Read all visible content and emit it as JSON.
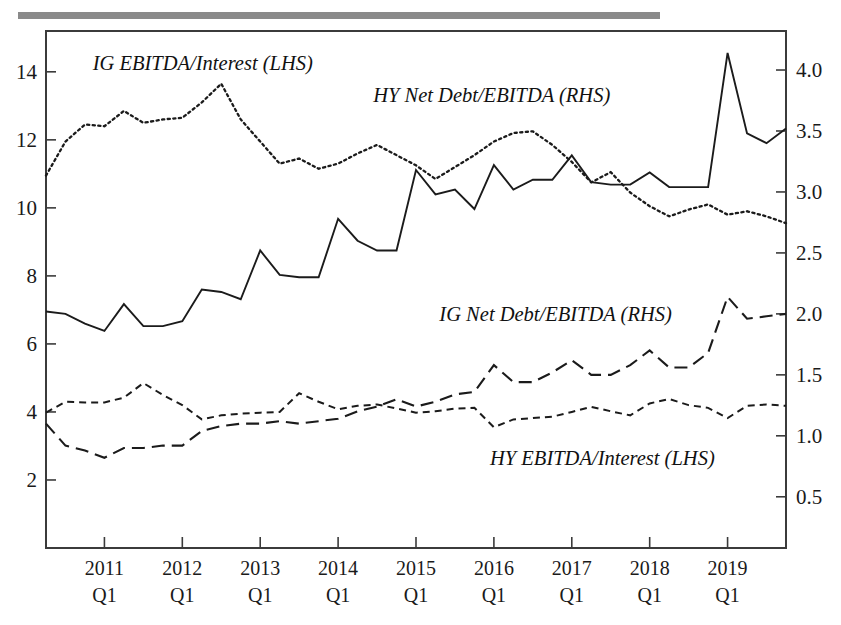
{
  "figure": {
    "top_rule": true,
    "background_color": "#ffffff",
    "line_color": "#1b1b1b"
  },
  "chart_data": {
    "type": "line",
    "title": "",
    "subtitle": "",
    "xlabel": "",
    "ylabel": "",
    "grid": false,
    "legend_position": "inline-annotations",
    "x_axis": {
      "tick_labels": [
        "2011",
        "2012",
        "2013",
        "2014",
        "2015",
        "2016",
        "2017",
        "2018",
        "2019"
      ],
      "tick_sublabels": [
        "Q1",
        "Q1",
        "Q1",
        "Q1",
        "Q1",
        "Q1",
        "Q1",
        "Q1",
        "Q1"
      ],
      "tick_x_values": [
        2011.0,
        2012.0,
        2013.0,
        2014.0,
        2015.0,
        2016.0,
        2017.0,
        2018.0,
        2019.0
      ],
      "xlim": [
        2010.25,
        2019.75
      ],
      "frequency": "quarterly"
    },
    "y_left": {
      "label": "LHS",
      "tick_labels": [
        "2",
        "4",
        "6",
        "8",
        "10",
        "12",
        "14"
      ],
      "tick_values": [
        2,
        4,
        6,
        8,
        10,
        12,
        14
      ],
      "ylim": [
        0,
        15.2
      ]
    },
    "y_right": {
      "label": "RHS",
      "tick_labels": [
        "0.5",
        "1.0",
        "1.5",
        "2.0",
        "2.5",
        "3.0",
        "3.5",
        "4.0"
      ],
      "tick_values": [
        0.5,
        1.0,
        1.5,
        2.0,
        2.5,
        3.0,
        3.5,
        4.0
      ],
      "ylim": [
        0.08,
        4.32
      ]
    },
    "x": [
      2010.25,
      2010.5,
      2010.75,
      2011.0,
      2011.25,
      2011.5,
      2011.75,
      2012.0,
      2012.25,
      2012.5,
      2012.75,
      2013.0,
      2013.25,
      2013.5,
      2013.75,
      2014.0,
      2014.25,
      2014.5,
      2014.75,
      2015.0,
      2015.25,
      2015.5,
      2015.75,
      2016.0,
      2016.25,
      2016.5,
      2016.75,
      2017.0,
      2017.25,
      2017.5,
      2017.75,
      2018.0,
      2018.25,
      2018.5,
      2018.75,
      2019.0,
      2019.25,
      2019.5,
      2019.75
    ],
    "series": [
      {
        "name": "IG EBITDA/Interest (LHS)",
        "axis": "left",
        "style": "dotted",
        "label_x": 2010.85,
        "label_y_left": 14.05,
        "values": [
          10.95,
          11.95,
          12.45,
          12.4,
          12.85,
          12.5,
          12.6,
          12.65,
          13.1,
          13.65,
          12.6,
          11.95,
          11.3,
          11.45,
          11.15,
          11.3,
          11.6,
          11.85,
          11.55,
          11.25,
          10.85,
          11.2,
          11.55,
          11.95,
          12.2,
          12.25,
          11.85,
          11.35,
          10.75,
          11.05,
          10.45,
          10.05,
          9.75,
          9.95,
          10.1,
          9.8,
          9.9,
          9.75,
          9.55
        ]
      },
      {
        "name": "HY Net Debt/EBITDA (RHS)",
        "axis": "right",
        "style": "solid",
        "label_x": 2014.45,
        "label_y_right": 3.74,
        "values": [
          2.02,
          2.0,
          1.92,
          1.86,
          2.08,
          1.9,
          1.9,
          1.94,
          2.2,
          2.18,
          2.12,
          2.52,
          2.32,
          2.3,
          2.3,
          2.78,
          2.6,
          2.52,
          2.52,
          3.18,
          2.98,
          3.02,
          2.86,
          3.22,
          3.02,
          3.1,
          3.1,
          3.3,
          3.08,
          3.06,
          3.06,
          3.16,
          3.04,
          3.04,
          3.04,
          4.14,
          3.48,
          3.4,
          3.52
        ]
      },
      {
        "name": "IG Net Debt/EBITDA (RHS)",
        "axis": "right",
        "style": "longdash",
        "label_x": 2015.3,
        "label_y_right": 1.94,
        "values": [
          1.1,
          0.92,
          0.88,
          0.82,
          0.9,
          0.9,
          0.92,
          0.92,
          1.04,
          1.08,
          1.1,
          1.1,
          1.12,
          1.1,
          1.12,
          1.14,
          1.2,
          1.24,
          1.3,
          1.24,
          1.28,
          1.34,
          1.36,
          1.58,
          1.44,
          1.44,
          1.52,
          1.62,
          1.5,
          1.5,
          1.58,
          1.7,
          1.56,
          1.56,
          1.68,
          2.14,
          1.96,
          1.98,
          2.0
        ]
      },
      {
        "name": "HY EBITDA/Interest (LHS)",
        "axis": "left",
        "style": "shortdash",
        "label_x": 2015.95,
        "label_y_left": 2.45,
        "values": [
          3.98,
          4.3,
          4.28,
          4.28,
          4.42,
          4.85,
          4.5,
          4.2,
          3.78,
          3.9,
          3.95,
          3.98,
          4.0,
          4.55,
          4.3,
          4.08,
          4.18,
          4.22,
          4.1,
          3.98,
          4.02,
          4.1,
          4.12,
          3.55,
          3.78,
          3.82,
          3.86,
          4.0,
          4.15,
          4.02,
          3.9,
          4.25,
          4.38,
          4.2,
          4.12,
          3.82,
          4.18,
          4.22,
          4.18
        ]
      }
    ]
  }
}
